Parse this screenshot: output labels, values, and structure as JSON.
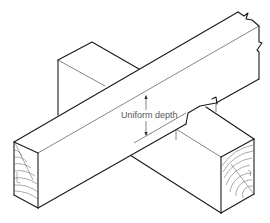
{
  "diagram": {
    "label": "Uniform depth",
    "colors": {
      "line": "#1a1a1a",
      "label": "#555555",
      "background": "#ffffff"
    }
  }
}
